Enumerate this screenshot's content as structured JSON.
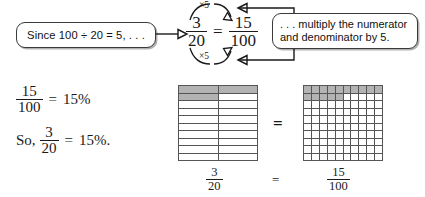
{
  "callouts": {
    "left": {
      "text": "Since 100 ÷ 20 = 5, . . ."
    },
    "right": {
      "line1": ". . . multiply the numerator",
      "line2": "and denominator by 5."
    }
  },
  "center_equation": {
    "left_fraction": {
      "numerator": "3",
      "denominator": "20"
    },
    "equals": "=",
    "right_fraction": {
      "numerator": "15",
      "denominator": "100"
    },
    "arc_top_label": "×5",
    "arc_bottom_label": "×5"
  },
  "steps": [
    {
      "fraction": {
        "numerator": "15",
        "denominator": "100"
      },
      "equals": "=",
      "result": "15%"
    },
    {
      "prefix": "So,",
      "fraction": {
        "numerator": "3",
        "denominator": "20"
      },
      "equals": "=",
      "result": "15%."
    }
  ],
  "models": {
    "twentieths": {
      "columns": 2,
      "rows": 10,
      "total_cells": 20,
      "shaded_cells": 3,
      "label": {
        "numerator": "3",
        "denominator": "20"
      }
    },
    "hundredths": {
      "columns": 10,
      "rows": 10,
      "total_cells": 100,
      "shaded_cells": 15,
      "label": {
        "numerator": "15",
        "denominator": "100"
      }
    },
    "equals_middle": "=",
    "equals_labels": "="
  },
  "colors": {
    "shaded_cell": "#b3b3b3",
    "grid_line": "#555555",
    "ink": "#1a1a1a",
    "background": "#ffffff"
  }
}
